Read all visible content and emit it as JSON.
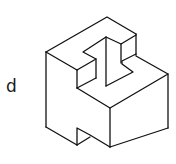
{
  "figure": {
    "option_label": "d",
    "stroke_color": "#111111",
    "background": "#ffffff"
  }
}
